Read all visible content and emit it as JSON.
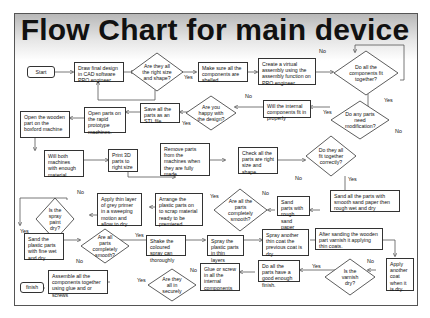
{
  "title": "Flow Chart for main device",
  "nodes": {
    "start": "Start",
    "draw": "Draw final design in CAD software PRO engineer",
    "right_size": "Are they all the right size and shape?",
    "shelled": "Make sure all the components are shelled.",
    "virtual": "Create a virtual assembly using the assembly function on PRO engineer.",
    "fit_together": "Do all the components fit together?",
    "internal_fit": "Will the internal components fit in properly",
    "happy": "Are you happy with the design?",
    "save_stl": "Save all the parts as an STL file",
    "open_rapid": "Open parts on the rapid prototype machines.",
    "open_wood": "Open the wooden part on the boxford machine",
    "modification": "Do any parts need modification?",
    "enough_material": "Will both machines with enough material.",
    "print3d": "Print 3D parts to right size",
    "remove": "Remove parts from the machines when they are fully made.",
    "check": "Check all the parts are right size and shape.",
    "fit_correctly": "Do they all fit together correctly?",
    "sand_smooth": "Sand all the parts with smooth sand paper then rough wet and dry",
    "sand_rough": "Sand parts with rough sand paper",
    "parts_smooth": "Are all the parts completely smooth?",
    "arrange": "Arrange the plastic parts on to scrap material ready to be premiered.",
    "primer": "Apply thin layer of grey primer in a sweeping motion and allow to dry",
    "spray_dry": "Is the spray paint dry?",
    "sand_fine": "Sand the plastic parts with fine wet and dry",
    "parts_smooth2": "Are all parts completely smooth?",
    "shake": "Shake the coloured spray can thoroughly",
    "spray_thin": "Spray the plastic parts in thin layers",
    "spray_another": "Spray another thin coat the previous coat is dry",
    "varnish": "After sanding the wooden part varnish it applying thin coats.",
    "another_coat": "Apply another coat when it is dry.",
    "varnish_dry": "Is the varnish dry?",
    "good_finish": "Do all the parts have a good enough finish.",
    "glue_screw": "Glue or screw in all the internal components",
    "secure": "Are they all in securely",
    "assemble": "Assemble all the components together using glue and or screws",
    "finish": "finish"
  },
  "labels": {
    "yes": "Yes",
    "no": "No"
  }
}
